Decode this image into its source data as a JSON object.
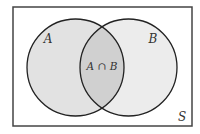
{
  "diagram": {
    "type": "venn",
    "universe": {
      "label": "S",
      "rect": {
        "x": 13,
        "y": 7,
        "width": 179,
        "height": 119
      },
      "fill": "#ffffff",
      "stroke": "#444444"
    },
    "sets": [
      {
        "id": "A",
        "label": "A",
        "cx": 75.5,
        "cy": 67.5,
        "r": 48.5,
        "fill": "#e2e2e2"
      },
      {
        "id": "B",
        "label": "B",
        "cx": 128.5,
        "cy": 67.5,
        "r": 48.5,
        "fill": "#eeeeee"
      }
    ],
    "intersection": {
      "label": "A ∩ B",
      "fill": "#d0d0d0"
    },
    "labels": {
      "set_a": "A",
      "set_b": "B",
      "intersection": "A ∩ B",
      "universe": "S"
    },
    "stroke_color": "#222222"
  }
}
